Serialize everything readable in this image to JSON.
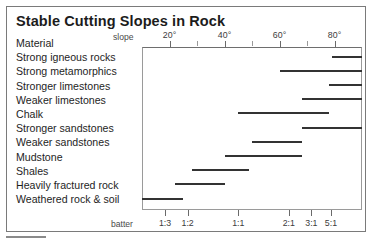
{
  "figure": {
    "title": "Stable Cutting Slopes in Rock",
    "slope_axis_caption": "slope",
    "batter_axis_caption": "batter",
    "material_header": "Material"
  },
  "chart_data": {
    "type": "bar",
    "title": "Stable Cutting Slopes in Rock",
    "xlabel": "slope",
    "xlabel_secondary": "batter",
    "ylabel": "Material",
    "orientation": "horizontal",
    "bar_style": "range",
    "xlim": [
      10,
      90
    ],
    "grid": false,
    "legend": false,
    "axis_top_ticks_major": [
      "20°",
      "40°",
      "60°",
      "80°"
    ],
    "axis_top_tick_values": [
      20,
      40,
      60,
      80
    ],
    "axis_top_minor_tick_values": [
      30,
      50,
      70
    ],
    "axis_bottom_ticks": [
      "1:3",
      "1:2",
      "1:1",
      "2:1",
      "3:1",
      "5:1"
    ],
    "axis_bottom_tick_values": [
      18.4,
      26.6,
      45,
      63.4,
      71.6,
      78.7
    ],
    "categories": [
      "Strong igneous rocks",
      "Strong metamorphics",
      "Stronger limestones",
      "Weaker limestones",
      "Chalk",
      "Stronger sandstones",
      "Weaker sandstones",
      "Mudstone",
      "Shales",
      "Heavily fractured rock",
      "Weathered rock & soil"
    ],
    "ranges": [
      {
        "material": "Strong igneous rocks",
        "min": 79,
        "max": 90
      },
      {
        "material": "Strong metamorphics",
        "min": 60,
        "max": 90
      },
      {
        "material": "Stronger limestones",
        "min": 78,
        "max": 90
      },
      {
        "material": "Weaker limestones",
        "min": 68,
        "max": 90
      },
      {
        "material": "Chalk",
        "min": 45,
        "max": 78
      },
      {
        "material": "Stronger sandstones",
        "min": 68,
        "max": 90
      },
      {
        "material": "Weaker sandstones",
        "min": 50,
        "max": 68
      },
      {
        "material": "Mudstone",
        "min": 40,
        "max": 68
      },
      {
        "material": "Shales",
        "min": 28,
        "max": 49
      },
      {
        "material": "Heavily fractured rock",
        "min": 22,
        "max": 40
      },
      {
        "material": "Weathered rock & soil",
        "min": 10,
        "max": 25
      }
    ]
  },
  "row_labels": [
    "Material",
    "Strong igneous rocks",
    "Strong metamorphics",
    "Stronger limestones",
    "Weaker limestones",
    "Chalk",
    "Stronger sandstones",
    "Weaker sandstones",
    "Mudstone",
    "Shales",
    "Heavily fractured rock",
    "Weathered rock & soil"
  ],
  "colors": {
    "bar": "#333333",
    "frame": "#7a7a7a",
    "plot_border": "#9a9a9a",
    "text": "#1e1e1e",
    "tick_text": "#3c3c3c",
    "background": "#ffffff"
  }
}
